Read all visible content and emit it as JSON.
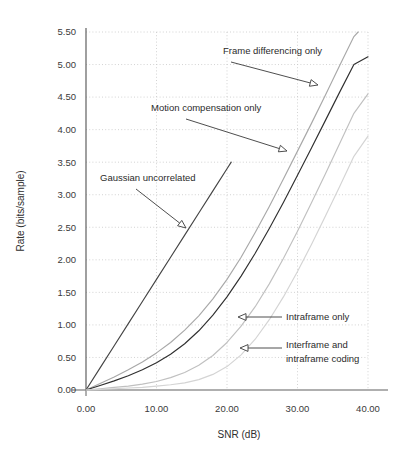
{
  "chart_data": {
    "type": "line",
    "title": "",
    "xlabel": "SNR (dB)",
    "ylabel": "Rate (bits/sample)",
    "xlim": [
      0,
      40
    ],
    "ylim": [
      0,
      5.5
    ],
    "grid": true,
    "legend_position": "none",
    "xticks": [
      "0.00",
      "10.00",
      "20.00",
      "30.00",
      "40.00"
    ],
    "xtick_values": [
      0,
      10,
      20,
      30,
      40
    ],
    "yticks": [
      "0.00",
      "0.50",
      "1.00",
      "1.50",
      "2.00",
      "2.50",
      "3.00",
      "3.50",
      "4.00",
      "4.50",
      "5.00",
      "5.50"
    ],
    "ytick_values": [
      0,
      0.5,
      1.0,
      1.5,
      2.0,
      2.5,
      3.0,
      3.5,
      4.0,
      4.5,
      5.0,
      5.5
    ],
    "series": [
      {
        "name": "Gaussian uncorrelated",
        "color": "#444444",
        "x": [
          0,
          2,
          4,
          6,
          8,
          10,
          12,
          14,
          16,
          18,
          20,
          20.6
        ],
        "y": [
          0.0,
          0.34,
          0.68,
          1.02,
          1.36,
          1.7,
          2.04,
          2.38,
          2.72,
          3.06,
          3.4,
          3.5
        ]
      },
      {
        "name": "Frame differencing only",
        "color": "#a8a8a8",
        "x": [
          0,
          2,
          4,
          6,
          8,
          10,
          12,
          14,
          16,
          18,
          20,
          22,
          24,
          26,
          28,
          30,
          32,
          34,
          36,
          38,
          38.6
        ],
        "y": [
          0.0,
          0.1,
          0.2,
          0.31,
          0.43,
          0.57,
          0.73,
          0.92,
          1.14,
          1.4,
          1.7,
          2.04,
          2.42,
          2.82,
          3.24,
          3.67,
          4.1,
          4.54,
          4.99,
          5.43,
          5.5
        ]
      },
      {
        "name": "Motion compensation only",
        "color": "#2f2f2f",
        "x": [
          0,
          2,
          4,
          6,
          8,
          10,
          12,
          14,
          16,
          18,
          20,
          22,
          24,
          26,
          28,
          30,
          32,
          34,
          36,
          38,
          40
        ],
        "y": [
          0.0,
          0.07,
          0.14,
          0.22,
          0.31,
          0.42,
          0.55,
          0.71,
          0.91,
          1.15,
          1.43,
          1.75,
          2.1,
          2.48,
          2.88,
          3.3,
          3.72,
          4.15,
          4.58,
          5.0,
          5.12
        ]
      },
      {
        "name": "Intraframe only",
        "color": "#c0c0c0",
        "x": [
          0,
          2,
          4,
          6,
          8,
          10,
          12,
          14,
          16,
          18,
          20,
          22,
          24,
          26,
          28,
          30,
          32,
          34,
          36,
          38,
          40
        ],
        "y": [
          0.0,
          0.02,
          0.04,
          0.06,
          0.09,
          0.13,
          0.19,
          0.27,
          0.38,
          0.53,
          0.73,
          0.98,
          1.28,
          1.63,
          2.02,
          2.44,
          2.88,
          3.33,
          3.79,
          4.25,
          4.55
        ]
      },
      {
        "name": "Interframe and intraframe coding",
        "color": "#d4d4d4",
        "x": [
          0,
          2,
          4,
          6,
          8,
          10,
          12,
          14,
          16,
          18,
          20,
          22,
          24,
          26,
          28,
          30,
          32,
          34,
          36,
          38,
          40
        ],
        "y": [
          0.0,
          0.01,
          0.02,
          0.03,
          0.04,
          0.06,
          0.08,
          0.11,
          0.16,
          0.24,
          0.36,
          0.54,
          0.78,
          1.08,
          1.43,
          1.82,
          2.24,
          2.68,
          3.13,
          3.59,
          3.9
        ]
      }
    ],
    "annotations": [
      {
        "label": "Frame differencing only",
        "text_x": 223,
        "text_y": 54,
        "arrow_from_x": 231,
        "arrow_from_y": 62,
        "arrow_to_x": 318,
        "arrow_to_y": 85
      },
      {
        "label": "Motion compensation only",
        "text_x": 151,
        "text_y": 111,
        "arrow_from_x": 186,
        "arrow_from_y": 119,
        "arrow_to_x": 287,
        "arrow_to_y": 151
      },
      {
        "label": "Gaussian uncorrelated",
        "text_x": 100,
        "text_y": 181,
        "arrow_from_x": 136,
        "arrow_from_y": 189,
        "arrow_to_x": 186,
        "arrow_to_y": 228
      },
      {
        "label": "Intraframe only",
        "text_x": 286,
        "text_y": 320,
        "arrow_from_x": 282,
        "arrow_from_y": 317,
        "arrow_to_x": 238,
        "arrow_to_y": 317
      },
      {
        "label": "Interframe and",
        "label2": "intraframe coding",
        "text_x": 286,
        "text_y": 348,
        "arrow_from_x": 282,
        "arrow_from_y": 348,
        "arrow_to_x": 240,
        "arrow_to_y": 348
      }
    ],
    "colors": {
      "axis": "#606060",
      "grid": "#c8c8c8",
      "text": "#2e2e2e",
      "background": "#ffffff"
    }
  }
}
